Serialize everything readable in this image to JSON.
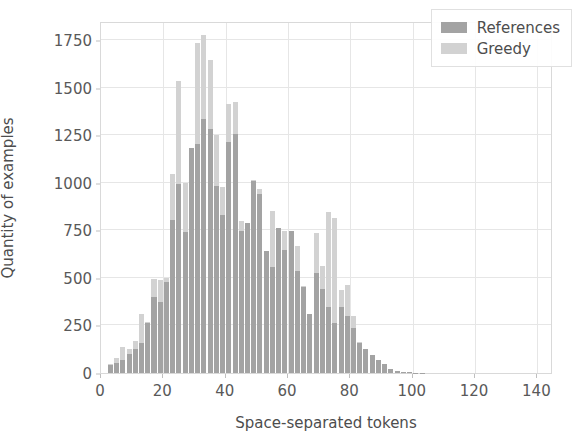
{
  "chart_data": {
    "type": "bar",
    "title": "",
    "subtitle": "",
    "xlabel": "Space-separated tokens",
    "ylabel": "Quantity of examples",
    "xlim": [
      0,
      145
    ],
    "ylim": [
      0,
      1850
    ],
    "xticks": [
      0,
      20,
      40,
      60,
      80,
      100,
      120,
      140
    ],
    "yticks": [
      0,
      250,
      500,
      750,
      1000,
      1250,
      1500,
      1750
    ],
    "grid": true,
    "legend_position": "upper right",
    "bin_width": 2,
    "overlap_mode": "overlay",
    "bin_centers": [
      3,
      5,
      7,
      9,
      11,
      13,
      15,
      17,
      19,
      21,
      23,
      25,
      27,
      29,
      31,
      33,
      35,
      37,
      39,
      41,
      43,
      45,
      47,
      49,
      51,
      53,
      55,
      57,
      59,
      61,
      63,
      65,
      67,
      69,
      71,
      73,
      75,
      77,
      79,
      81,
      83,
      85,
      87,
      89,
      91,
      93,
      95,
      97,
      99,
      101,
      103
    ],
    "series": [
      {
        "name": "References",
        "color": "#a3a3a3",
        "values": [
          40,
          55,
          70,
          100,
          125,
          160,
          265,
          400,
          375,
          480,
          805,
          995,
          740,
          1180,
          1205,
          1335,
          1280,
          985,
          830,
          1215,
          1255,
          745,
          790,
          1010,
          940,
          640,
          555,
          760,
          645,
          745,
          535,
          450,
          310,
          525,
          440,
          345,
          265,
          345,
          300,
          235,
          160,
          125,
          95,
          70,
          45,
          20,
          12,
          6,
          4,
          2,
          1
        ]
      },
      {
        "name": "Greedy",
        "color": "#d2d2d2",
        "values": [
          50,
          80,
          135,
          125,
          170,
          310,
          270,
          495,
          490,
          500,
          1045,
          1535,
          1000,
          1005,
          1735,
          1775,
          1645,
          1250,
          980,
          1415,
          1425,
          800,
          790,
          1015,
          965,
          640,
          850,
          760,
          745,
          720,
          670,
          455,
          310,
          735,
          565,
          845,
          815,
          435,
          460,
          300,
          165,
          75,
          18,
          10,
          6,
          5,
          3,
          2,
          1,
          1,
          0
        ]
      }
    ]
  },
  "legend": {
    "entries": [
      {
        "label": "References",
        "swatch_color": "#a3a3a3"
      },
      {
        "label": "Greedy",
        "swatch_color": "#d2d2d2"
      }
    ]
  },
  "axis_labels": {
    "x_title": "Space-separated tokens",
    "y_title": "Quantity of examples"
  },
  "colors": {
    "references": "#a3a3a3",
    "greedy": "#d2d2d2",
    "grid": "#e6e6e6",
    "axis_text": "#595959",
    "background": "#ffffff"
  }
}
